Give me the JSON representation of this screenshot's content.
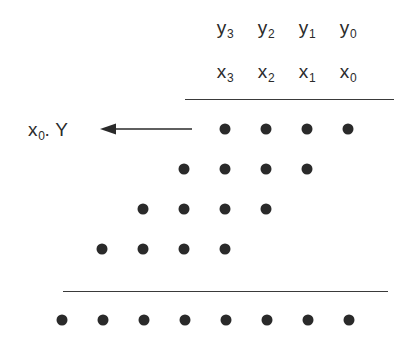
{
  "figure": {
    "background_color": "#ffffff",
    "ink_color": "#2a2a2a",
    "dot_color": "#2a2a2a",
    "rule_color": "#3a3a3a"
  },
  "multiplicand_row": {
    "name": "y-operand-header",
    "symbol": "y",
    "labels": [
      {
        "base": "y",
        "sub": "3",
        "text": "y3",
        "x": 225
      },
      {
        "base": "y",
        "sub": "2",
        "text": "y2",
        "x": 266
      },
      {
        "base": "y",
        "sub": "1",
        "text": "y1",
        "x": 307
      },
      {
        "base": "y",
        "sub": "0",
        "text": "y0",
        "x": 348
      }
    ]
  },
  "multiplier_row": {
    "name": "x-operand-header",
    "symbol": "x",
    "labels": [
      {
        "base": "x",
        "sub": "3",
        "text": "x3",
        "x": 225
      },
      {
        "base": "x",
        "sub": "2",
        "text": "x2",
        "x": 266
      },
      {
        "base": "x",
        "sub": "1",
        "text": "x1",
        "x": 307
      },
      {
        "base": "x",
        "sub": "0",
        "text": "x0",
        "x": 348
      }
    ]
  },
  "annotation": {
    "name": "first-partial-product-label",
    "base": "x",
    "sub": "0",
    "suffix": ". Y",
    "text": "x0 . Y",
    "x": 28,
    "y": 129
  },
  "arrow": {
    "name": "partial-product-arrow",
    "direction": "left",
    "x_start": 192,
    "x_end": 100,
    "y": 129
  },
  "rules": [
    {
      "name": "top-rule",
      "x1": 185,
      "x2": 394,
      "y": 99
    },
    {
      "name": "sum-rule",
      "x1": 63,
      "x2": 388,
      "y": 291
    }
  ],
  "partial_product_rows": [
    {
      "name": "partial-product-row-0",
      "y": 129,
      "dots_x": [
        225,
        266,
        307,
        348
      ]
    },
    {
      "name": "partial-product-row-1",
      "y": 169,
      "dots_x": [
        184,
        225,
        266,
        307
      ]
    },
    {
      "name": "partial-product-row-2",
      "y": 209,
      "dots_x": [
        143,
        184,
        225,
        266
      ]
    },
    {
      "name": "partial-product-row-3",
      "y": 249,
      "dots_x": [
        102,
        143,
        184,
        225
      ]
    }
  ],
  "result_row": {
    "name": "product-row",
    "y": 320,
    "dots_x": [
      62,
      103,
      144,
      185,
      226,
      267,
      308,
      349
    ]
  }
}
